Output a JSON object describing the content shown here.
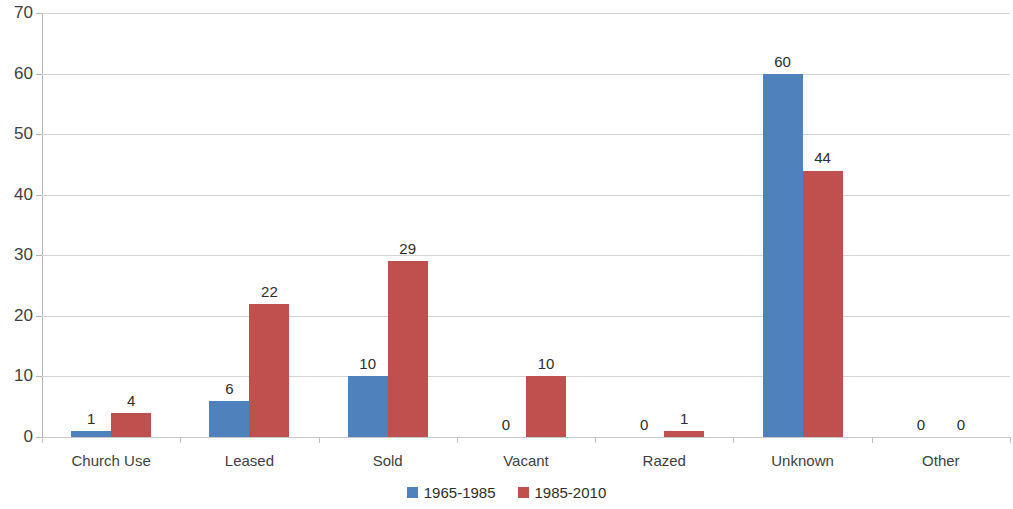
{
  "chart_data": {
    "type": "bar",
    "title": "",
    "xlabel": "",
    "ylabel": "",
    "ylim": [
      0,
      70
    ],
    "ytick_step": 10,
    "yticks": [
      0,
      10,
      20,
      30,
      40,
      50,
      60,
      70
    ],
    "grid": true,
    "legend_position": "bottom-center",
    "data_labels": true,
    "categories": [
      "Church Use",
      "Leased",
      "Sold",
      "Vacant",
      "Razed",
      "Unknown",
      "Other"
    ],
    "series": [
      {
        "name": "1965-1985",
        "color": "#4F81BD",
        "values": [
          1,
          6,
          10,
          0,
          0,
          60,
          0
        ]
      },
      {
        "name": "1985-2010",
        "color": "#C0504D",
        "values": [
          4,
          22,
          29,
          10,
          1,
          44,
          0
        ]
      }
    ]
  },
  "axis": {
    "y_tick_labels": [
      "0",
      "10",
      "20",
      "30",
      "40",
      "50",
      "60",
      "70"
    ]
  },
  "colors": {
    "series_1965_1985": "#4F81BD",
    "series_1985_2010": "#C0504D",
    "gridline": "#D4D4D4",
    "axis": "#B5B5B5",
    "text": "#3F3F3F",
    "background": "#FFFFFF"
  }
}
